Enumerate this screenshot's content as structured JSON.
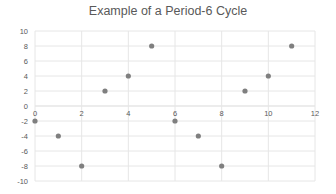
{
  "chart_data": {
    "type": "scatter",
    "title": "Example of a Period-6 Cycle",
    "xlabel": "",
    "ylabel": "",
    "xlim": [
      0,
      12
    ],
    "ylim": [
      -10,
      10
    ],
    "x_ticks": [
      0,
      2,
      4,
      6,
      8,
      10,
      12
    ],
    "y_ticks": [
      10,
      8,
      6,
      4,
      2,
      0,
      -2,
      -4,
      -6,
      -8,
      -10
    ],
    "grid": true,
    "legend": null,
    "series": [
      {
        "name": "Series1",
        "color": "#7f7f7f",
        "x": [
          0,
          1,
          2,
          3,
          4,
          5,
          6,
          7,
          8,
          9,
          10,
          11
        ],
        "y": [
          -2,
          -4,
          -8,
          2,
          4,
          8,
          -2,
          -4,
          -8,
          2,
          4,
          8
        ]
      }
    ]
  },
  "colors": {
    "grid": "#e6e6e6",
    "axis": "#d9d9d9",
    "tick_label": "#595959",
    "marker": "#7f7f7f"
  }
}
